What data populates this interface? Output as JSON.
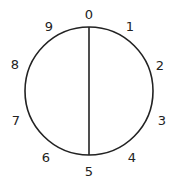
{
  "diagram": {
    "title": "",
    "circle": {
      "cx": 89,
      "cy": 91,
      "r": 64,
      "stroke": "#222222"
    },
    "chord": {
      "from_label": "0",
      "to_label": "5"
    },
    "labels": [
      {
        "text": "0",
        "x": 89,
        "y": 19
      },
      {
        "text": "1",
        "x": 130,
        "y": 31
      },
      {
        "text": "2",
        "x": 160,
        "y": 70
      },
      {
        "text": "3",
        "x": 162,
        "y": 125
      },
      {
        "text": "4",
        "x": 132,
        "y": 162
      },
      {
        "text": "5",
        "x": 89,
        "y": 176
      },
      {
        "text": "6",
        "x": 46,
        "y": 162
      },
      {
        "text": "7",
        "x": 16,
        "y": 125
      },
      {
        "text": "8",
        "x": 15,
        "y": 69
      },
      {
        "text": "9",
        "x": 49,
        "y": 31
      }
    ]
  }
}
